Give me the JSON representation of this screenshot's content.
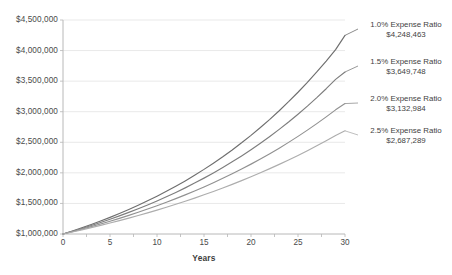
{
  "chart_data": {
    "type": "line",
    "title": "",
    "subtitle": "",
    "xlabel": "Years",
    "ylabel": "",
    "xlim": [
      0,
      30
    ],
    "ylim": [
      1000000,
      4500000
    ],
    "grid": true,
    "legend_position": "right-annotations",
    "x": [
      0,
      1,
      2,
      3,
      4,
      5,
      6,
      7,
      8,
      9,
      10,
      11,
      12,
      13,
      14,
      15,
      16,
      17,
      18,
      19,
      20,
      21,
      22,
      23,
      24,
      25,
      26,
      27,
      28,
      29,
      30
    ],
    "x_tick_labels": [
      "0",
      "5",
      "10",
      "15",
      "20",
      "25",
      "30"
    ],
    "x_ticks": [
      0,
      5,
      10,
      15,
      20,
      25,
      30
    ],
    "y_tick_labels": [
      "$4,500,000",
      "$4,000,000",
      "$3,500,000",
      "$3,000,000",
      "$2,500,000",
      "$2,000,000",
      "$1,500,000",
      "$1,000,000"
    ],
    "y_ticks": [
      4500000,
      4000000,
      3500000,
      3000000,
      2500000,
      2000000,
      1500000,
      1000000
    ],
    "start_value": 1000000,
    "series": [
      {
        "name": "1.0% Expense Ratio",
        "ratio_label": "1.0% Expense Ratio",
        "end_value_label": "$4,248,463",
        "end_value": 4248463,
        "growth_rate": 0.04934,
        "color": "#6e6e6e",
        "values": [
          1000000,
          1049340,
          1101114,
          1155437,
          1212432,
          1272225,
          1334950,
          1400747,
          1469763,
          1542152,
          1618076,
          1697703,
          1781212,
          1868788,
          1960626,
          2056931,
          2157915,
          2263804,
          2374832,
          2491245,
          2613301,
          2741271,
          2875437,
          3016097,
          3163561,
          3318157,
          3480227,
          3650130,
          3828243,
          4014962,
          4248463
        ]
      },
      {
        "name": "1.5% Expense Ratio",
        "ratio_label": "1.5% Expense Ratio",
        "end_value_label": "$3,649,748",
        "end_value": 3649748,
        "growth_rate": 0.04417,
        "color": "#7d7d7d",
        "values": [
          1000000,
          1044170,
          1090289,
          1138445,
          1188729,
          1241237,
          1296071,
          1353337,
          1413147,
          1475618,
          1540875,
          1609046,
          1680267,
          1754681,
          1832438,
          1913695,
          1998616,
          2087375,
          2180154,
          2277144,
          2378545,
          2484568,
          2595434,
          2711376,
          2832637,
          2959474,
          3092157,
          3230968,
          3376205,
          3528181,
          3649748
        ]
      },
      {
        "name": "2.0% Expense Ratio",
        "ratio_label": "2.0% Expense Ratio",
        "end_value_label": "$3,132,984",
        "end_value": 3132984,
        "growth_rate": 0.03877,
        "color": "#919191",
        "values": [
          1000000,
          1038770,
          1079040,
          1120870,
          1164322,
          1209460,
          1256353,
          1305070,
          1355685,
          1408275,
          1462920,
          1519704,
          1578715,
          1640045,
          1703790,
          1770050,
          1838930,
          1910540,
          1984995,
          2062415,
          2142926,
          2226660,
          2313756,
          2404358,
          2498617,
          2596691,
          2698746,
          2804955,
          2915500,
          3030570,
          3132984
        ]
      },
      {
        "name": "2.5% Expense Ratio",
        "ratio_label": "2.5% Expense Ratio",
        "end_value_label": "$2,687,289",
        "end_value": 2687289,
        "growth_rate": 0.03356,
        "color": "#adadad",
        "values": [
          1000000,
          1033560,
          1068246,
          1104096,
          1141148,
          1179443,
          1219023,
          1259931,
          1302214,
          1345918,
          1391093,
          1437790,
          1486062,
          1535964,
          1587555,
          1640894,
          1696043,
          1753068,
          1812036,
          1873018,
          1936086,
          2001317,
          2068791,
          2138589,
          2210799,
          2285509,
          2362814,
          2442810,
          2525600,
          2611290,
          2687289
        ]
      }
    ]
  },
  "axis": {
    "axis_line_color": "#b8b8b8",
    "grid_color": "#e9e9e9",
    "tick_color": "#c4c4c4"
  }
}
